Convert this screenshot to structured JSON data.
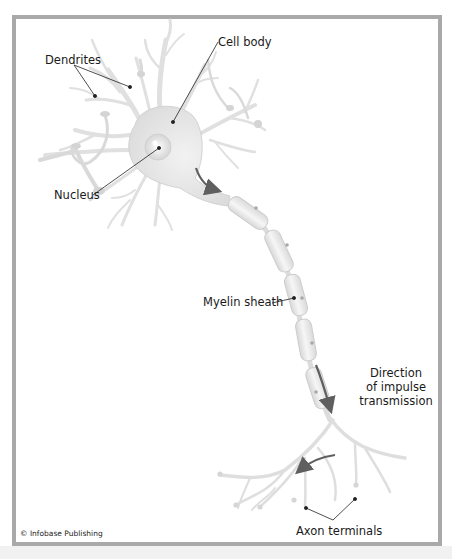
{
  "figure": {
    "type": "neuron-anatomy-diagram",
    "colors": {
      "frame_border": "#a9a9a9",
      "neuron_fill": "#e6e6e6",
      "neuron_stroke": "#cfcfcf",
      "myelin_fill": "#ececec",
      "arrow": "#5f5f5f",
      "leader_line": "#222222",
      "bottom_strip": "#f1f1f1"
    }
  },
  "labels": {
    "dendrites": "Dendrites",
    "cell_body": "Cell body",
    "nucleus": "Nucleus",
    "myelin_sheath": "Myelin sheath",
    "direction_line1": "Direction",
    "direction_line2": "of impulse",
    "direction_line3": "transmission",
    "axon_terminals": "Axon terminals"
  },
  "credit": "© Infobase Publishing"
}
